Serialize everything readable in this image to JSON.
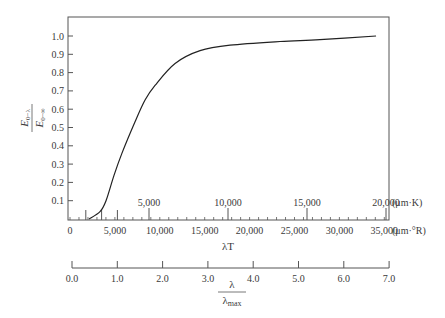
{
  "chart_data": {
    "type": "line",
    "title": "",
    "ylabel": "E(0-λ) / E(0-∞)",
    "ylabel_parts": {
      "num_main": "E",
      "num_sub": "0−λ",
      "den_main": "E",
      "den_sub": "0−∞"
    },
    "xlabel": "λT",
    "xlabel2": "λ / λmax",
    "xlabel2_parts": {
      "num": "λ",
      "den_main": "λ",
      "den_sub": "max"
    },
    "ylim": [
      0,
      1.0
    ],
    "yticks": [
      "0.1",
      "0.2",
      "0.3",
      "0.4",
      "0.5",
      "0.6",
      "0.7",
      "0.8",
      "0.9",
      "1.0"
    ],
    "grid": false,
    "axes": {
      "upper_kelvin": {
        "unit": "(μm·K)",
        "range": [
          0,
          20000
        ],
        "ticks": [
          "5,000",
          "10,000",
          "15,000",
          "20,000"
        ]
      },
      "lower_rankine": {
        "unit": "(μm·°R)",
        "range": [
          0,
          36000
        ],
        "ticks": [
          "0",
          "5,000",
          "10,000",
          "15,000",
          "20,000",
          "25,000",
          "30,000",
          "35,000"
        ]
      },
      "lambda_ratio": {
        "range": [
          0,
          7.0
        ],
        "ticks": [
          "0.0",
          "1.0",
          "2.0",
          "3.0",
          "4.0",
          "5.0",
          "6.0",
          "7.0"
        ]
      }
    },
    "series": [
      {
        "name": "Blackbody fraction",
        "x_unit": "μm·K",
        "x": [
          1200,
          1900,
          2280,
          2790,
          3290,
          4110,
          4750,
          5380,
          6650,
          8230,
          10130,
          13290,
          15820,
          19370
        ],
        "y": [
          0.0,
          0.04,
          0.1,
          0.24,
          0.36,
          0.53,
          0.65,
          0.73,
          0.85,
          0.92,
          0.95,
          0.97,
          0.98,
          1.0
        ]
      }
    ]
  }
}
